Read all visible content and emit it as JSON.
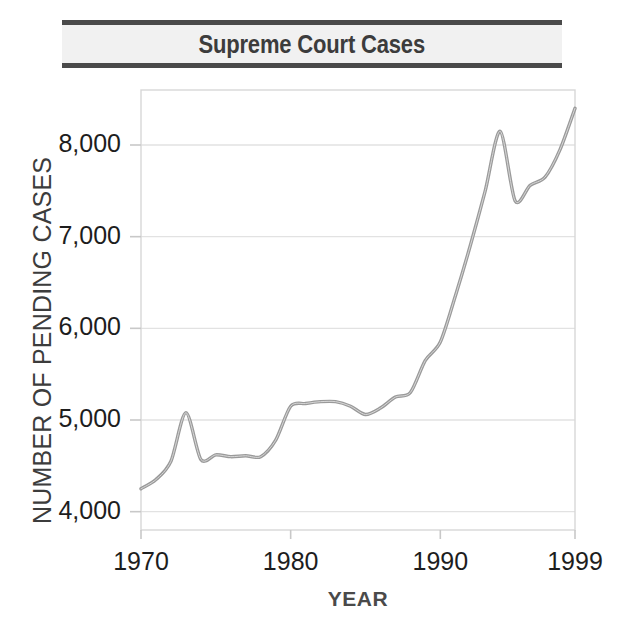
{
  "chart_title": "Supreme Court Cases",
  "chart_data": {
    "type": "line",
    "title": "Supreme Court Cases",
    "subtitle": "",
    "xlabel": "YEAR",
    "ylabel": "NUMBER OF PENDING CASES",
    "xlim": [
      1970,
      1999
    ],
    "ylim": [
      3800,
      8600
    ],
    "grid": true,
    "legend_position": "none",
    "line_color": "#9a9a9a",
    "xticks": [
      1970,
      1980,
      1990,
      1999
    ],
    "xtick_labels": [
      "1970",
      "1980",
      "1990",
      "1999"
    ],
    "yticks": [
      4000,
      5000,
      6000,
      7000,
      8000
    ],
    "ytick_labels": [
      "4,000",
      "5,000",
      "6,000",
      "7,000",
      "8,000"
    ],
    "x": [
      1970,
      1971,
      1972,
      1973,
      1974,
      1975,
      1976,
      1977,
      1978,
      1979,
      1980,
      1981,
      1982,
      1983,
      1984,
      1985,
      1986,
      1987,
      1988,
      1989,
      1990,
      1991,
      1992,
      1993,
      1994,
      1995,
      1996,
      1997,
      1998,
      1999
    ],
    "values": [
      4250,
      4350,
      4550,
      5080,
      4570,
      4620,
      4600,
      4610,
      4600,
      4780,
      5150,
      5180,
      5200,
      5200,
      5150,
      5060,
      5130,
      5250,
      5300,
      5650,
      5850,
      6350,
      6900,
      7500,
      8150,
      7390,
      7560,
      7650,
      7950,
      8400
    ],
    "annotations": []
  },
  "axis_style": {
    "grid_color": "#e2e2e2",
    "frame_color": "#d7d7d7",
    "tick_color": "#c8c8c8",
    "title_band_color": "#f1f1f1",
    "rule_color": "#4a4a4a",
    "text_color": "#1d1d1d"
  }
}
